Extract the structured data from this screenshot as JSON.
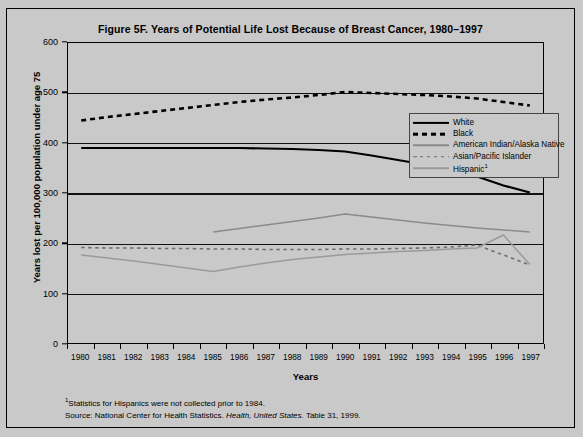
{
  "figure": {
    "title": "Figure 5F. Years of Potential Life Lost Because of Breast Cancer, 1980–1997"
  },
  "axes": {
    "x_title": "Years",
    "y_title": "Years lost per 100,000 population under age 75"
  },
  "legend": {
    "items": [
      {
        "label": "White",
        "style": "solid-thick",
        "color": "#000000"
      },
      {
        "label": "Black",
        "style": "dashed-thick",
        "color": "#000000"
      },
      {
        "label": "American Indian/Alaska Native",
        "style": "solid-thin",
        "color": "#8a8a8a"
      },
      {
        "label": "Asian/Pacific Islander",
        "style": "dashed-thin",
        "color": "#6e6e6e"
      },
      {
        "label": "Hispanic",
        "superscript": "1",
        "style": "solid-thin",
        "color": "#9a9a9a"
      }
    ]
  },
  "footnotes": {
    "line1_sup": "1",
    "line1": "Statistics for Hispanics were not collected prior to 1984.",
    "line2_prefix": "Source: National Center for Health Statistics. ",
    "line2_italic": "Health, United States.",
    "line2_suffix": " Table 31, 1999."
  },
  "chart_data": {
    "type": "line",
    "title": "Figure 5F. Years of Potential Life Lost Because of Breast Cancer, 1980–1997",
    "xlabel": "Years",
    "ylabel": "Years lost per 100,000 population under age 75",
    "xlim": [
      1980,
      1997
    ],
    "ylim": [
      0,
      600
    ],
    "yticks": [
      0,
      100,
      200,
      300,
      400,
      500,
      600
    ],
    "grid": true,
    "legend_position": "inside-right",
    "categories": [
      1980,
      1981,
      1982,
      1983,
      1984,
      1985,
      1986,
      1987,
      1988,
      1989,
      1990,
      1991,
      1992,
      1993,
      1994,
      1995,
      1996,
      1997
    ],
    "series": [
      {
        "name": "White",
        "color": "#000000",
        "style": "solid-thick",
        "values": [
          390,
          390,
          390,
          390,
          390,
          390,
          390,
          389,
          388,
          386,
          383,
          375,
          366,
          357,
          347,
          333,
          315,
          301
        ]
      },
      {
        "name": "Black",
        "color": "#000000",
        "style": "dashed-thick",
        "values": [
          445,
          452,
          458,
          464,
          470,
          476,
          482,
          487,
          491,
          496,
          502,
          500,
          498,
          496,
          493,
          489,
          482,
          475
        ]
      },
      {
        "name": "American Indian/Alaska Native",
        "color": "#8a8a8a",
        "style": "solid-thin",
        "values": [
          null,
          null,
          null,
          null,
          null,
          222,
          229,
          236,
          243,
          250,
          258,
          252,
          246,
          240,
          235,
          230,
          226,
          222
        ]
      },
      {
        "name": "Asian/Pacific Islander",
        "color": "#6e6e6e",
        "style": "dashed-thin",
        "values": [
          191,
          190,
          190,
          189,
          189,
          188,
          188,
          187,
          187,
          187,
          188,
          188,
          189,
          190,
          192,
          196,
          176,
          156
        ]
      },
      {
        "name": "Hispanic",
        "color": "#9a9a9a",
        "style": "solid-thin",
        "values": [
          176,
          170,
          164,
          157,
          150,
          143,
          152,
          160,
          167,
          172,
          177,
          180,
          183,
          185,
          188,
          190,
          216,
          157
        ]
      }
    ]
  }
}
